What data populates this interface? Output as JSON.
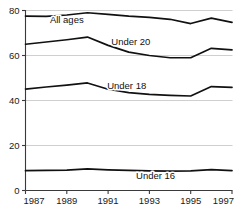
{
  "chart_data": {
    "type": "line",
    "title": "",
    "subtitle": "",
    "xlabel": "",
    "ylabel": "",
    "x": [
      1987,
      1988,
      1989,
      1990,
      1991,
      1992,
      1993,
      1994,
      1995,
      1996,
      1997
    ],
    "xlim": [
      1987,
      1997
    ],
    "ylim": [
      0,
      80
    ],
    "xticks": [
      1987,
      1989,
      1991,
      1993,
      1995,
      1997
    ],
    "xtick_labels": [
      "1987",
      "1989",
      "1991",
      "1993",
      "1995",
      "1997"
    ],
    "yticks": [
      0,
      20,
      40,
      60,
      80
    ],
    "ytick_labels": [
      "0",
      "20",
      "40",
      "60",
      "80"
    ],
    "grid": true,
    "legend": "inline-labels",
    "line_color": "#111111",
    "grid_color": "#cfcfcf",
    "axis_color": "#3a3a3a",
    "series": [
      {
        "name": "All ages",
        "label": "All ages",
        "label_x": 1989.0,
        "label_y": 74.6,
        "values": [
          77.5,
          77.4,
          78.0,
          79.0,
          78.3,
          77.5,
          76.9,
          76.1,
          74.2,
          76.6,
          74.7
        ]
      },
      {
        "name": "Under 20",
        "label": "Under 20",
        "label_x": 1992.1,
        "label_y": 64.6,
        "values": [
          65.0,
          66.0,
          67.0,
          68.2,
          64.5,
          61.5,
          60.0,
          59.0,
          59.0,
          63.2,
          62.5
        ]
      },
      {
        "name": "Under 18",
        "label": "Under 18",
        "label_x": 1991.9,
        "label_y": 45.1,
        "values": [
          45.1,
          46.0,
          46.8,
          47.8,
          45.0,
          43.5,
          42.7,
          42.3,
          42.0,
          46.2,
          45.8
        ]
      },
      {
        "name": "Under 16",
        "label": "Under 16",
        "label_x": 1993.3,
        "label_y": 5.0,
        "values": [
          8.8,
          8.9,
          9.1,
          9.6,
          9.2,
          8.9,
          8.7,
          8.6,
          8.7,
          9.3,
          8.8
        ]
      }
    ]
  }
}
